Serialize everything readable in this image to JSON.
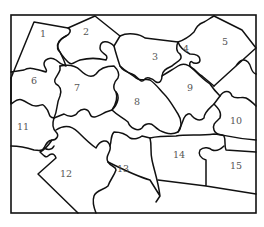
{
  "diagram": {
    "type": "jigsaw-puzzle",
    "stroke_color": "#111111",
    "label_color": "#555555",
    "background": "#ffffff",
    "pieces": [
      {
        "label": "1",
        "x": 40,
        "y": 37
      },
      {
        "label": "2",
        "x": 85,
        "y": 34
      },
      {
        "label": "3",
        "x": 155,
        "y": 58
      },
      {
        "label": "4",
        "x": 186,
        "y": 50
      },
      {
        "label": "5",
        "x": 225,
        "y": 43
      },
      {
        "label": "6",
        "x": 34,
        "y": 82
      },
      {
        "label": "7",
        "x": 76,
        "y": 89
      },
      {
        "label": "8",
        "x": 136,
        "y": 103
      },
      {
        "label": "9",
        "x": 190,
        "y": 89
      },
      {
        "label": "10",
        "x": 236,
        "y": 122
      },
      {
        "label": "11",
        "x": 22,
        "y": 128
      },
      {
        "label": "12",
        "x": 66,
        "y": 175
      },
      {
        "label": "13",
        "x": 123,
        "y": 170
      },
      {
        "label": "14",
        "x": 179,
        "y": 156
      },
      {
        "label": "15",
        "x": 236,
        "y": 167
      }
    ]
  }
}
